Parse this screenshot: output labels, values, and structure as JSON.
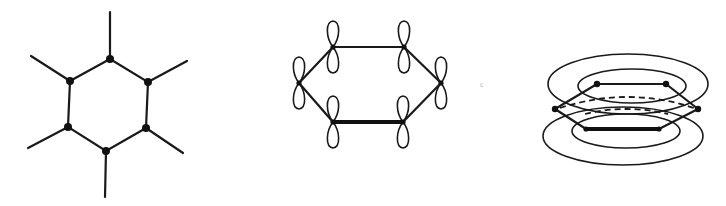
{
  "figure": {
    "panels": [
      {
        "id": "sigma-framework",
        "description": "Benzene sigma-bond skeleton with six C atoms and six substituent bonds",
        "atoms": [
          [
            110,
            59
          ],
          [
            148,
            82
          ],
          [
            146,
            128
          ],
          [
            106,
            151
          ],
          [
            68,
            127
          ],
          [
            70,
            81
          ]
        ],
        "stubs": [
          [
            110,
            12
          ],
          [
            187,
            61
          ],
          [
            183,
            153
          ],
          [
            105,
            197
          ],
          [
            28,
            148
          ],
          [
            31,
            56
          ]
        ]
      },
      {
        "id": "p-orbitals",
        "description": "Ring of six carbons each with a p orbital (two lobes) perpendicular to the ring",
        "atoms": [
          [
            333,
            47
          ],
          [
            404,
            47
          ],
          [
            441,
            83
          ],
          [
            403,
            122
          ],
          [
            333,
            122
          ],
          [
            299,
            83
          ]
        ],
        "lobe_length": 24,
        "thick_bond": [
          [
            333,
            122
          ],
          [
            403,
            122
          ]
        ]
      },
      {
        "id": "pi-cloud",
        "description": "Delocalized pi electron clouds above and below the hexagonal ring",
        "hexagon": [
          [
            597,
            84
          ],
          [
            666,
            84
          ],
          [
            698,
            109
          ],
          [
            659,
            129
          ],
          [
            586,
            129
          ],
          [
            555,
            109
          ]
        ],
        "ellipses": [
          {
            "cx": 628,
            "cy": 84,
            "rx": 80,
            "ry": 30
          },
          {
            "cx": 632,
            "cy": 86,
            "rx": 54,
            "ry": 17
          },
          {
            "cx": 623,
            "cy": 136,
            "rx": 80,
            "ry": 29
          },
          {
            "cx": 626,
            "cy": 130,
            "rx": 54,
            "ry": 17
          }
        ]
      }
    ],
    "colors": {
      "ink": "#1a1a1a",
      "background": "#ffffff"
    }
  }
}
